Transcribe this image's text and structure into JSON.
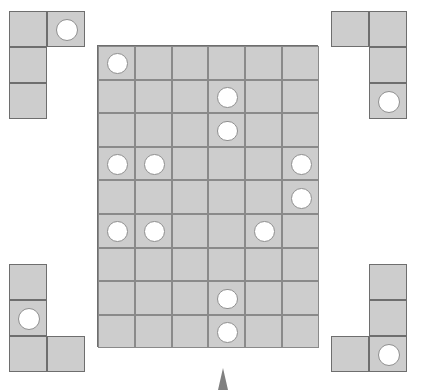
{
  "scene": {
    "title": "Pentomino placement puzzle",
    "background_color": "#ffffff",
    "cell_fill_color": "#cdcdcd",
    "cell_border_color": "#8a8a8a",
    "piece_border_color": "#6e6e6e",
    "disc_fill_color": "#ffffff",
    "disc_border_color": "#8f8f8f",
    "pointer_color": "#808080"
  },
  "board": {
    "name": "main-grid",
    "columns": 6,
    "rows": 9,
    "x": 97,
    "y": 45,
    "cell_width": 36.8,
    "cell_height": 33.6,
    "discs": [
      {
        "row": 0,
        "col": 0
      },
      {
        "row": 1,
        "col": 3
      },
      {
        "row": 2,
        "col": 3
      },
      {
        "row": 3,
        "col": 0
      },
      {
        "row": 3,
        "col": 1
      },
      {
        "row": 3,
        "col": 5
      },
      {
        "row": 4,
        "col": 5
      },
      {
        "row": 5,
        "col": 0
      },
      {
        "row": 5,
        "col": 1
      },
      {
        "row": 5,
        "col": 4
      },
      {
        "row": 7,
        "col": 3
      },
      {
        "row": 8,
        "col": 3
      }
    ],
    "disc_count": 12
  },
  "pieces": [
    {
      "name": "piece-top-left",
      "label": "Top-left L piece",
      "x": 9,
      "y": 11,
      "cell_width": 38,
      "cell_height": 36,
      "cells": [
        {
          "row": 0,
          "col": 0
        },
        {
          "row": 0,
          "col": 1
        },
        {
          "row": 1,
          "col": 0
        },
        {
          "row": 2,
          "col": 0
        }
      ],
      "discs": [
        {
          "row": 0,
          "col": 1
        }
      ]
    },
    {
      "name": "piece-top-right",
      "label": "Top-right L piece",
      "x": 331,
      "y": 11,
      "cell_width": 38,
      "cell_height": 36,
      "cells": [
        {
          "row": 0,
          "col": 0
        },
        {
          "row": 0,
          "col": 1
        },
        {
          "row": 1,
          "col": 1
        },
        {
          "row": 2,
          "col": 1
        }
      ],
      "discs": [
        {
          "row": 2,
          "col": 1
        }
      ]
    },
    {
      "name": "piece-bottom-left",
      "label": "Bottom-left L piece",
      "x": 9,
      "y": 264,
      "cell_width": 38,
      "cell_height": 36,
      "cells": [
        {
          "row": 0,
          "col": 0
        },
        {
          "row": 1,
          "col": 0
        },
        {
          "row": 2,
          "col": 0
        },
        {
          "row": 2,
          "col": 1
        }
      ],
      "discs": [
        {
          "row": 1,
          "col": 0
        }
      ]
    },
    {
      "name": "piece-bottom-right",
      "label": "Bottom-right J piece",
      "x": 331,
      "y": 264,
      "cell_width": 38,
      "cell_height": 36,
      "cells": [
        {
          "row": 0,
          "col": 1
        },
        {
          "row": 1,
          "col": 1
        },
        {
          "row": 2,
          "col": 0
        },
        {
          "row": 2,
          "col": 1
        }
      ],
      "discs": [
        {
          "row": 2,
          "col": 1
        }
      ]
    }
  ],
  "pointer": {
    "name": "drag-pointer",
    "x": 218,
    "y": 368,
    "width": 10,
    "height": 22
  }
}
